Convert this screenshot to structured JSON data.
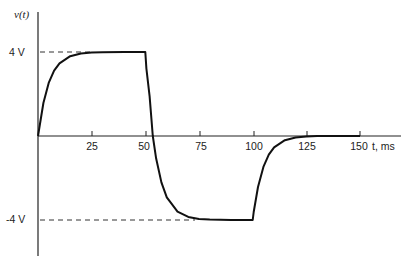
{
  "chart_data": {
    "type": "line",
    "title": "",
    "xlabel": "t, ms",
    "ylabel": "v(t)",
    "x_ticks": [
      25,
      50,
      75,
      100,
      125,
      150
    ],
    "y_ticks": [
      {
        "value": 4,
        "label": "4 V"
      },
      {
        "value": -4,
        "label": "-4 V"
      }
    ],
    "xlim": [
      0,
      160
    ],
    "ylim": [
      -5.5,
      5
    ],
    "grid": false,
    "legend": null,
    "series": [
      {
        "name": "v(t)",
        "description": "Exponential rise 0→4 V (τ≈5 ms) on 0–50 ms; exponential fall from 4 V toward -4 V on 50–100 ms; exponential rise from -4 V to 0 on 100–150 ms",
        "x": [
          0,
          2.5,
          5,
          7.5,
          10,
          15,
          20,
          25,
          30,
          40,
          50,
          50.5,
          52,
          53.5,
          55,
          57.5,
          60,
          65,
          70,
          75,
          80,
          90,
          100,
          100.5,
          102.5,
          105,
          107.5,
          110,
          115,
          120,
          125,
          130,
          140,
          150
        ],
        "values": [
          0,
          1.57,
          2.53,
          3.11,
          3.46,
          3.8,
          3.93,
          3.97,
          3.99,
          4.0,
          4.0,
          3.21,
          1.9,
          0.0,
          -1.06,
          -2.21,
          -2.92,
          -3.6,
          -3.85,
          -3.95,
          -3.98,
          -4.0,
          -4.0,
          -3.62,
          -2.43,
          -1.47,
          -0.89,
          -0.54,
          -0.2,
          -0.07,
          -0.03,
          0,
          0,
          0
        ]
      }
    ],
    "reference_lines": [
      {
        "type": "dashed-horizontal",
        "value": 4,
        "x_range": [
          0,
          24
        ]
      },
      {
        "type": "dashed-horizontal",
        "value": -4,
        "x_range": [
          0,
          72
        ]
      }
    ]
  }
}
